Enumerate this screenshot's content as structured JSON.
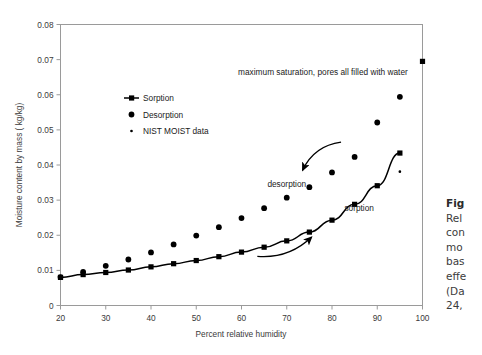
{
  "chart_data": {
    "type": "scatter",
    "title": "",
    "xlabel": "Percent relative humidity",
    "ylabel": "Moisture content by mass ( kg/kg)",
    "xlim": [
      20,
      100
    ],
    "ylim": [
      0,
      0.08
    ],
    "xticks": [
      20,
      30,
      40,
      50,
      60,
      70,
      80,
      90,
      100
    ],
    "yticks": [
      "0",
      "0.01",
      "0.02",
      "0.03",
      "0.04",
      "0.05",
      "0.06",
      "0.07",
      "0.08"
    ],
    "grid": false,
    "legend_position": "upper-left-inside",
    "series": [
      {
        "name": "Sorption",
        "marker": "square",
        "line": true,
        "color": "#000000",
        "x": [
          20,
          25,
          30,
          35,
          40,
          45,
          50,
          55,
          60,
          65,
          70,
          75,
          80,
          85,
          90,
          95
        ],
        "values": [
          0.008,
          0.0088,
          0.0094,
          0.0101,
          0.011,
          0.0119,
          0.0128,
          0.0139,
          0.0152,
          0.0166,
          0.0184,
          0.0209,
          0.0243,
          0.0288,
          0.0341,
          0.0434
        ]
      },
      {
        "name": "Desorption",
        "marker": "circle",
        "line": false,
        "color": "#000000",
        "x": [
          20,
          25,
          30,
          35,
          40,
          45,
          50,
          55,
          60,
          65,
          70,
          75,
          80,
          85,
          90,
          95
        ],
        "values": [
          0.0081,
          0.0096,
          0.0113,
          0.0131,
          0.0151,
          0.0174,
          0.0199,
          0.0223,
          0.0249,
          0.0277,
          0.0307,
          0.0337,
          0.0379,
          0.0423,
          0.0521,
          0.0594
        ]
      },
      {
        "name": "NIST MOIST data",
        "marker": "dot",
        "line": false,
        "color": "#000000",
        "x": [
          20,
          25,
          30,
          95
        ],
        "values": [
          0.0082,
          0.0092,
          0.0096,
          0.0381
        ]
      },
      {
        "name": "maximum saturation point",
        "marker": "square",
        "line": false,
        "color": "#000000",
        "x": [
          100
        ],
        "values": [
          0.0695
        ]
      }
    ],
    "annotations": [
      {
        "text": "maximum saturation, pores all filled with water",
        "x": 78,
        "y": 0.0655
      },
      {
        "text": "desorption",
        "x": 70,
        "y": 0.0337
      },
      {
        "text": "sorption",
        "x": 86,
        "y": 0.0268
      }
    ],
    "arrows": [
      {
        "name": "desorption-arrow",
        "from_x": 82,
        "from_y": 0.0465,
        "to_x": 73.5,
        "to_y": 0.0385
      },
      {
        "name": "sorption-arrow",
        "from_x": 63.5,
        "from_y": 0.014,
        "to_x": 75.5,
        "to_y": 0.0195
      }
    ]
  },
  "legend": {
    "items": [
      {
        "label": "Sorption"
      },
      {
        "label": "Desorption"
      },
      {
        "label": "NIST MOIST data"
      }
    ]
  },
  "caption": {
    "lines": [
      "Fig",
      "Rel",
      "con",
      "mo",
      "bas",
      "effe",
      "(Da",
      "24,"
    ]
  }
}
